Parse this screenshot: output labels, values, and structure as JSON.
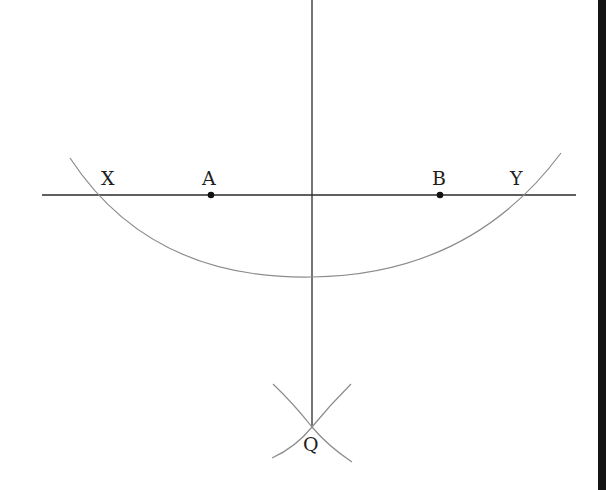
{
  "diagram": {
    "colors": {
      "line": "#2a2a2a",
      "arc": "#8c8c8c",
      "point": "#111111",
      "edge": "#141414"
    },
    "horizontal_line": {
      "x1": 42,
      "y1": 195,
      "x2": 576,
      "y2": 195
    },
    "vertical_line": {
      "x1": 312,
      "y1": 0,
      "x2": 312,
      "y2": 427
    },
    "points": [
      {
        "label": "A",
        "x": 211,
        "y": 195,
        "dot": true,
        "label_x": 202,
        "label_y": 185
      },
      {
        "label": "B",
        "x": 440,
        "y": 195,
        "dot": true,
        "label_x": 432,
        "label_y": 185
      },
      {
        "label": "X",
        "x": 103,
        "y": 195,
        "dot": false,
        "label_x": 101,
        "label_y": 185
      },
      {
        "label": "Y",
        "x": 520,
        "y": 195,
        "dot": false,
        "label_x": 510,
        "label_y": 185
      },
      {
        "label": "Q",
        "x": 312,
        "y": 427,
        "dot": false,
        "label_x": 303,
        "label_y": 451
      }
    ],
    "main_arc": {
      "path": "M 70 158 Q 150 280 312 277 Q 470 275 561 153"
    },
    "q_arcs": [
      {
        "path": "M 273 384 Q 293 403 312 427 Q 328 446 352 462"
      },
      {
        "path": "M 351 384 Q 330 405 312 427 Q 296 447 272 458"
      }
    ]
  }
}
